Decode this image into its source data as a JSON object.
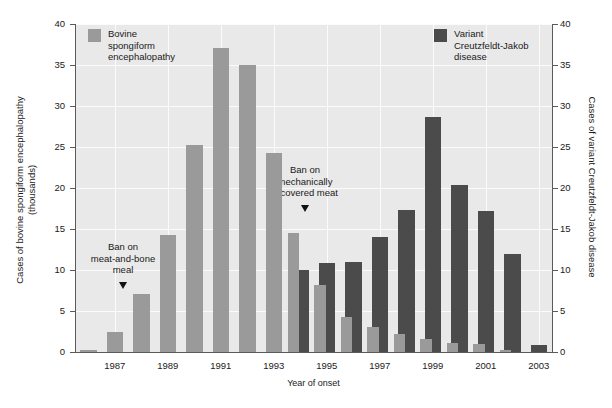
{
  "chart_data": {
    "type": "bar",
    "title": "",
    "xlabel": "Year of onset",
    "ylabel_left": "Cases of bovine spongiform encephalopathy\n(thousands)",
    "ylabel_right": "Cases of variant Creutzfeldt-Jakob disease",
    "categories": [
      1986,
      1987,
      1988,
      1989,
      1990,
      1991,
      1992,
      1993,
      1994,
      1995,
      1996,
      1997,
      1998,
      1999,
      2000,
      2001,
      2002,
      2003
    ],
    "x_tick_labels": [
      "1987",
      "1989",
      "1991",
      "1993",
      "1995",
      "1997",
      "1999",
      "2001",
      "2003"
    ],
    "y_tick_labels_left": [
      "0",
      "5",
      "10",
      "15",
      "20",
      "25",
      "30",
      "35",
      "40"
    ],
    "y_tick_labels_right": [
      "0",
      "5",
      "10",
      "15",
      "20",
      "25",
      "30",
      "35",
      "40"
    ],
    "ylim_left": [
      0,
      40
    ],
    "ylim_right": [
      0,
      40
    ],
    "grid": true,
    "legend_position": "inside-top",
    "series": [
      {
        "name": "Bovine spongiform encephalopathy",
        "color": "#9a9a9a",
        "unit": "thousands of cases",
        "values": [
          0.3,
          2.5,
          7.1,
          14.3,
          25.2,
          37.1,
          35.0,
          24.3,
          14.5,
          8.2,
          4.3,
          3.0,
          2.2,
          1.6,
          1.1,
          1.0,
          0.3,
          0.0
        ]
      },
      {
        "name": "Variant Creutzfeldt-Jakob disease",
        "color": "#4b4b4b",
        "unit": "cases",
        "values": [
          0,
          0,
          0,
          0,
          0,
          0,
          0,
          0,
          10.0,
          10.9,
          11.0,
          14.0,
          17.3,
          28.6,
          20.4,
          17.2,
          12.0,
          0.9
        ]
      }
    ],
    "annotations": [
      {
        "id": "ban-meat-and-bone-meal",
        "text": "Ban on\nmeat-and-bone\nmeal",
        "points_to_year": 1988
      },
      {
        "id": "ban-mechanically-recovered-meat",
        "text": "Ban on\nmechanically\nrecovered meat",
        "points_to_year": 1995
      }
    ]
  },
  "legend": {
    "bse": {
      "label": "Bovine\nspongiform\nencephalopathy",
      "color": "#9a9a9a"
    },
    "vcjd": {
      "label": "Variant\nCreutzfeldt-Jakob\ndisease",
      "color": "#4b4b4b"
    }
  },
  "axes": {
    "x_title": "Year of onset",
    "y_left_title": "Cases of bovine spongiform encephalopathy\n(thousands)",
    "y_right_title": "Cases of variant Creutzfeldt-Jakob disease"
  },
  "annotations": {
    "mbm": "Ban on\nmeat-and-bone\nmeal",
    "mrm": "Ban on\nmechanically\nrecovered meat"
  }
}
